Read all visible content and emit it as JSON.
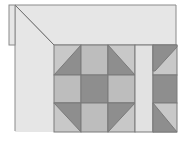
{
  "diagram": {
    "type": "quilt-block-layout",
    "colors": {
      "background": "#ffffff",
      "border_fill": "#e6e6e6",
      "light": "#c8c8c8",
      "medium": "#a8a8a8",
      "dark": "#8a8a8a",
      "sashing": "#e2e2e2",
      "stroke": "#7a7a7a"
    }
  }
}
